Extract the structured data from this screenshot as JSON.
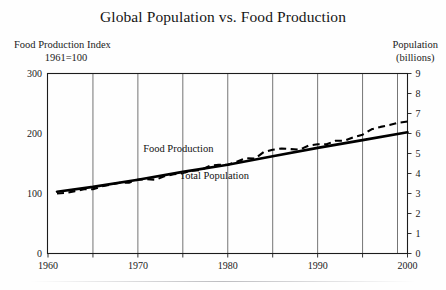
{
  "figure": {
    "title": "Global Population vs. Food Production",
    "left_axis_label_line1": "Food Production Index",
    "left_axis_label_line2": "1961=100",
    "right_axis_label_line1": "Population",
    "right_axis_label_line2": "(billions)"
  },
  "chart_data": {
    "type": "line",
    "title": "Global Population vs. Food Production",
    "xlabel": "",
    "ylabel": "Food Production Index 1961=100",
    "ylabel_right": "Population (billions)",
    "xlim": [
      1960,
      2000
    ],
    "ylim": [
      0,
      300
    ],
    "ylim_right": [
      0,
      9
    ],
    "grid": "vertical-gridlines-every-5-years",
    "legend": "inline-labels",
    "x_ticks": [
      1960,
      1965,
      1970,
      1975,
      1980,
      1985,
      1990,
      1995,
      2000
    ],
    "x_tick_labels": [
      "1960",
      "",
      "1970",
      "",
      "1980",
      "",
      "1990",
      "",
      "2000"
    ],
    "y_ticks_left": [
      0,
      100,
      200,
      300
    ],
    "y_tick_labels_left": [
      "0",
      "100",
      "200",
      "300"
    ],
    "y_ticks_right": [
      0,
      1,
      2,
      3,
      4,
      5,
      6,
      7,
      8,
      9
    ],
    "y_tick_labels_right": [
      "0",
      "1",
      "2",
      "3",
      "4",
      "5",
      "6",
      "7",
      "8",
      "9"
    ],
    "series": [
      {
        "name": "Food Production",
        "label": "Food Production",
        "style": "dashed",
        "axis": "left",
        "label_position": {
          "x": 1974.5,
          "y": 170
        },
        "x": [
          1961,
          1962,
          1963,
          1964,
          1965,
          1966,
          1967,
          1968,
          1969,
          1970,
          1971,
          1972,
          1973,
          1974,
          1975,
          1976,
          1977,
          1978,
          1979,
          1980,
          1981,
          1982,
          1983,
          1984,
          1985,
          1986,
          1987,
          1988,
          1989,
          1990,
          1991,
          1992,
          1993,
          1994,
          1995,
          1996,
          1997,
          1998,
          1999,
          2000
        ],
        "values": [
          100,
          101,
          104,
          107,
          107,
          112,
          115,
          118,
          118,
          123,
          124,
          123,
          129,
          132,
          134,
          138,
          139,
          146,
          148,
          148,
          153,
          159,
          158,
          169,
          173,
          175,
          174,
          173,
          180,
          182,
          182,
          188,
          188,
          194,
          198,
          207,
          211,
          214,
          218,
          220
        ]
      },
      {
        "name": "Total Population",
        "label": "Total Population",
        "style": "solid",
        "axis": "right",
        "label_position": {
          "x": 1978.5,
          "y": 125
        },
        "x": [
          1961,
          1965,
          1970,
          1975,
          1980,
          1985,
          1990,
          1995,
          2000
        ],
        "values_billions": [
          3.08,
          3.33,
          3.7,
          4.07,
          4.44,
          4.85,
          5.27,
          5.68,
          6.07
        ],
        "values_index_equiv": [
          103,
          111,
          123,
          136,
          148,
          162,
          176,
          189,
          202
        ]
      }
    ]
  }
}
